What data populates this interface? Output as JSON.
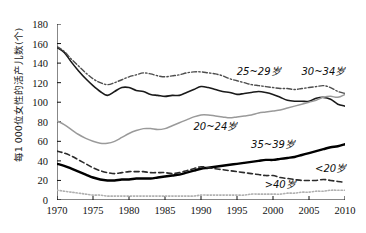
{
  "chart_data": {
    "type": "line",
    "title": "",
    "xlabel": "",
    "ylabel": "每1 000位女性的活产儿数(个)",
    "xlim": [
      1970,
      2010
    ],
    "ylim": [
      0,
      180
    ],
    "xticks": [
      "1970",
      "1975",
      "1980",
      "1985",
      "1990",
      "1995",
      "2000",
      "2005",
      "2010"
    ],
    "yticks": [
      "0",
      "20",
      "40",
      "60",
      "80",
      "100",
      "120",
      "140",
      "160",
      "180"
    ],
    "grid": false,
    "legend_position": "inline-annotations",
    "x": [
      1970,
      1971,
      1972,
      1973,
      1974,
      1975,
      1976,
      1977,
      1978,
      1979,
      1980,
      1981,
      1982,
      1983,
      1984,
      1985,
      1986,
      1987,
      1988,
      1989,
      1990,
      1991,
      1992,
      1993,
      1994,
      1995,
      1996,
      1997,
      1998,
      1999,
      2000,
      2001,
      2002,
      2003,
      2004,
      2005,
      2006,
      2007,
      2008,
      2009,
      2010
    ],
    "series": [
      {
        "name": "20~24岁",
        "label": "20~24岁",
        "style": "solid-thin-black",
        "color": "#1a1a1a",
        "values": [
          156,
          151,
          141,
          132,
          124,
          117,
          111,
          107,
          111,
          115,
          115,
          112,
          111,
          108,
          107,
          106,
          107,
          107,
          110,
          113,
          116,
          115,
          113,
          111,
          110,
          108,
          109,
          110,
          111,
          110,
          108,
          105,
          102,
          101,
          101,
          101,
          104,
          105,
          103,
          98,
          96
        ]
      },
      {
        "name": "25~29岁",
        "label": "25~29岁",
        "style": "dash-dot-gray",
        "color": "#4d4d4d",
        "values": [
          157,
          152,
          144,
          137,
          130,
          124,
          120,
          118,
          120,
          123,
          126,
          128,
          130,
          129,
          127,
          126,
          127,
          128,
          130,
          131,
          131,
          130,
          129,
          127,
          124,
          122,
          120,
          118,
          117,
          116,
          115,
          114,
          114,
          113,
          114,
          115,
          116,
          117,
          115,
          111,
          109
        ]
      },
      {
        "name": "30~34岁",
        "label": "30~34岁",
        "style": "solid-gray",
        "color": "#9a9a9a",
        "values": [
          81,
          77,
          72,
          67,
          63,
          60,
          58,
          58,
          60,
          64,
          68,
          71,
          73,
          73,
          72,
          73,
          76,
          79,
          82,
          85,
          87,
          87,
          86,
          85,
          84,
          85,
          86,
          87,
          89,
          90,
          91,
          92,
          94,
          96,
          98,
          100,
          102,
          105,
          106,
          105,
          108
        ]
      },
      {
        "name": "35~39岁",
        "label": "35~39岁",
        "style": "solid-thick-black",
        "color": "#000000",
        "values": [
          37,
          35,
          32,
          29,
          26,
          23,
          21,
          20,
          20,
          21,
          21,
          22,
          22,
          22,
          23,
          24,
          25,
          26,
          28,
          30,
          32,
          33,
          34,
          35,
          36,
          37,
          38,
          39,
          40,
          41,
          41,
          42,
          43,
          44,
          46,
          48,
          50,
          52,
          54,
          55,
          57
        ]
      },
      {
        "name": "<20岁",
        "label": "<20岁",
        "style": "dashed-black",
        "color": "#2b2b2b",
        "values": [
          50,
          48,
          45,
          41,
          37,
          33,
          30,
          28,
          27,
          28,
          29,
          29,
          29,
          28,
          28,
          28,
          27,
          28,
          30,
          32,
          34,
          33,
          32,
          31,
          30,
          29,
          28,
          27,
          26,
          25,
          25,
          23,
          22,
          21,
          20,
          20,
          20,
          21,
          20,
          19,
          18
        ]
      },
      {
        "name": ">40岁",
        "label": ">40岁",
        "style": "dotted-gray",
        "color": "#b0b0b0",
        "values": [
          10,
          9,
          8,
          7,
          6,
          5,
          5,
          4,
          4,
          4,
          4,
          4,
          4,
          4,
          4,
          4,
          4,
          4,
          4,
          4,
          5,
          5,
          5,
          5,
          5,
          5,
          5,
          6,
          6,
          6,
          6,
          6,
          7,
          7,
          8,
          8,
          9,
          9,
          10,
          10,
          10
        ]
      }
    ],
    "annotations": [
      {
        "text": "25~29岁",
        "x": 1998,
        "y": 133
      },
      {
        "text": "30~34岁",
        "x": 2007,
        "y": 133
      },
      {
        "text": "20~24岁",
        "x": 1992,
        "y": 77
      },
      {
        "text": "35~39岁",
        "x": 2000,
        "y": 58
      },
      {
        "text": "<20岁",
        "x": 2008,
        "y": 34
      },
      {
        "text": ">40岁",
        "x": 2001,
        "y": 17
      }
    ]
  }
}
